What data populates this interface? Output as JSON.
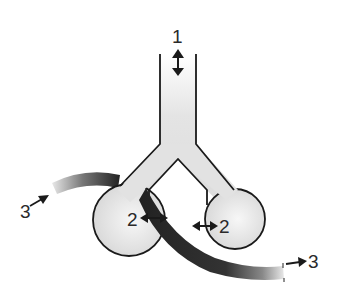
{
  "diagram": {
    "type": "Y-shaped bulb apparatus with tube",
    "labels": [
      {
        "id": "1",
        "text": "1",
        "meaning": "vertical double-headed arrow at stem opening"
      },
      {
        "id": "2a",
        "text": "2",
        "meaning": "horizontal double-headed arrow, left bulb"
      },
      {
        "id": "2b",
        "text": "2",
        "meaning": "horizontal double-headed arrow, right bulb"
      },
      {
        "id": "3a",
        "text": "3",
        "meaning": "inflow arrow into curved tube, left"
      },
      {
        "id": "3b",
        "text": "3",
        "meaning": "outflow arrow from curved tube, right"
      }
    ],
    "colors": {
      "outline": "#1a1a1a",
      "body_fill": "#e2e2e2",
      "tube_dark": "#2b2b2b",
      "tube_light": "#d8d8d8"
    }
  }
}
